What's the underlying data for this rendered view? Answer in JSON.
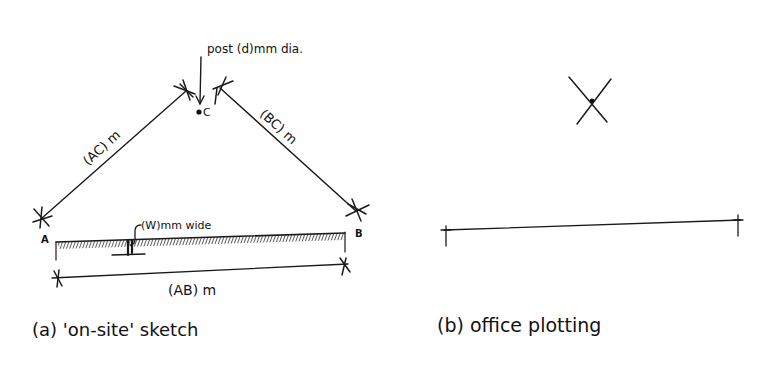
{
  "panel_a": {
    "caption": "(a) 'on-site' sketch",
    "labels": {
      "post": "post (d)mm dia.",
      "point_c": "C",
      "point_a": "A",
      "point_b": "B",
      "side_ac": "(AC) m",
      "side_bc": "(BC) m",
      "side_ab": "(AB) m",
      "wall_width": "(W)mm wide"
    }
  },
  "panel_b": {
    "caption": "(b) office plotting"
  },
  "colors": {
    "ink": "#1a1a1a",
    "background": "#ffffff"
  }
}
